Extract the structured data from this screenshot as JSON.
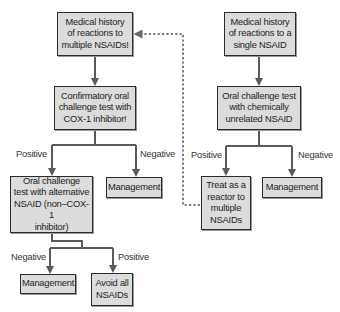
{
  "diagram": {
    "type": "flowchart",
    "colors": {
      "box_fill": "#dcdcdc",
      "box_border": "#2b2b2b",
      "arrow": "#5a5a5a",
      "dashed_arrow": "#7a7a7a"
    },
    "nodes": {
      "multi_history": "Medical history\nof reactions to\nmultiple NSAIDs!",
      "single_history": "Medical history\nof reactions to a\nsingle NSAID",
      "confirm_test": "Confirmatory oral\nchallenge test with\nCOX-1 inhibitor!",
      "unrelated_test": "Oral challenge test\nwith chemically\nunrelated NSAID",
      "alternative_test": "Oral challenge\ntest with alternative\nNSAID (non–COX-1\ninhibitor)",
      "management_mid_left": "Management",
      "treat_as_reactor": "Treat as a\nreactor to\nmultiple\nNSAIDs",
      "management_mid_right": "Management",
      "management_bottom": "Management",
      "avoid_all": "Avoid all\nNSAIDs"
    },
    "edge_labels": {
      "confirm_positive": "Positive",
      "confirm_negative": "Negative",
      "unrelated_positive": "Positive",
      "unrelated_negative": "Negative",
      "alternative_negative": "Negative",
      "alternative_positive": "Positive"
    },
    "edges": [
      {
        "from": "multi_history",
        "to": "confirm_test",
        "label": ""
      },
      {
        "from": "confirm_test",
        "to": "alternative_test",
        "label": "Positive"
      },
      {
        "from": "confirm_test",
        "to": "management_mid_left",
        "label": "Negative"
      },
      {
        "from": "alternative_test",
        "to": "management_bottom",
        "label": "Negative"
      },
      {
        "from": "alternative_test",
        "to": "avoid_all",
        "label": "Positive"
      },
      {
        "from": "single_history",
        "to": "unrelated_test",
        "label": ""
      },
      {
        "from": "unrelated_test",
        "to": "treat_as_reactor",
        "label": "Positive"
      },
      {
        "from": "unrelated_test",
        "to": "management_mid_right",
        "label": "Negative"
      },
      {
        "from": "treat_as_reactor",
        "to": "multi_history",
        "label": "",
        "style": "dashed"
      }
    ]
  }
}
